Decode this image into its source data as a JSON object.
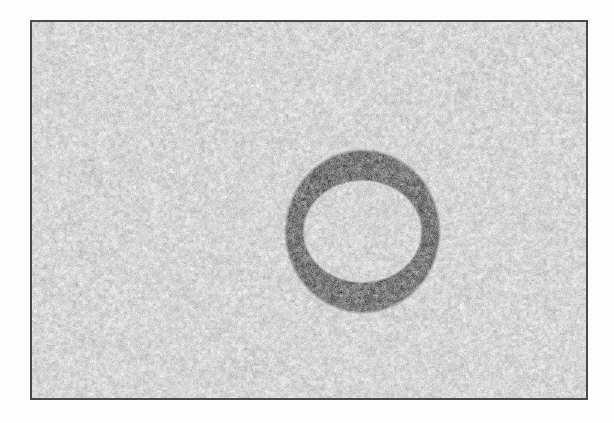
{
  "figure": {
    "title": "Noisy grayscale image containing a single annulus",
    "canvas_width": 614,
    "canvas_height": 423,
    "page_background": "#ffffff"
  },
  "frame": {
    "name": "image-plate-border",
    "x": 30,
    "y": 20,
    "width": 558,
    "height": 380,
    "border_color": "#4a4a4a",
    "border_width_px": 2
  },
  "background_field": {
    "description": "uniform speckle / grain texture",
    "base_color": "#d9d9d9",
    "noise_low": "#bdbdbd",
    "noise_high": "#efefef",
    "grain_scale_px": 2
  },
  "annulus": {
    "label": "annulus",
    "center_x": 330,
    "center_y": 209,
    "outer_radius_x": 77,
    "outer_radius_y": 81,
    "inner_radius_x": 59,
    "inner_radius_y": 51,
    "fill_base_color": "#858585",
    "fill_noise_low": "#5a5a5a",
    "fill_noise_high": "#a2a2a2",
    "interior_matches_background": true
  },
  "chart_data": {
    "type": "heatmap",
    "title": "Noisy grayscale image containing a single annulus",
    "subtitle": "",
    "xlabel": "",
    "ylabel": "",
    "grid": false,
    "legend": "none",
    "xlim": [
      0,
      558
    ],
    "ylim": [
      0,
      380
    ],
    "colormap": "gray",
    "value_range": [
      0.0,
      1.0
    ],
    "regions": [
      {
        "name": "background",
        "shape": "rectangle",
        "mean_intensity": 0.85,
        "noise_std": 0.06,
        "bounds": [
          0,
          0,
          558,
          380
        ]
      },
      {
        "name": "annulus-band",
        "shape": "annulus",
        "mean_intensity": 0.52,
        "noise_std": 0.09,
        "center": [
          330,
          209
        ],
        "outer_radius": [
          77,
          81
        ],
        "inner_radius": [
          59,
          51
        ]
      },
      {
        "name": "annulus-hole",
        "shape": "ellipse",
        "mean_intensity": 0.85,
        "noise_std": 0.06,
        "center": [
          330,
          209
        ],
        "radius": [
          59,
          51
        ]
      }
    ]
  }
}
